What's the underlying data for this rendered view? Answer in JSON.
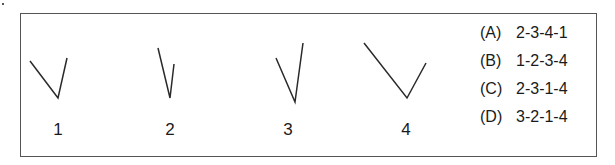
{
  "figures": [
    {
      "label": "1",
      "arm_a": [
        30,
        61
      ],
      "vertex": [
        58,
        98
      ],
      "arm_b": [
        67,
        58
      ],
      "label_x": 48
    },
    {
      "label": "2",
      "arm_a": [
        158,
        48
      ],
      "vertex": [
        170,
        98
      ],
      "arm_b": [
        174,
        64
      ],
      "label_x": 160
    },
    {
      "label": "3",
      "arm_a": [
        276,
        58
      ],
      "vertex": [
        295,
        102
      ],
      "arm_b": [
        303,
        43
      ],
      "label_x": 278
    },
    {
      "label": "4",
      "arm_a": [
        364,
        43
      ],
      "vertex": [
        407,
        98
      ],
      "arm_b": [
        426,
        63
      ],
      "label_x": 396
    }
  ],
  "options": [
    {
      "key": "(A)",
      "value": "2-3-4-1"
    },
    {
      "key": "(B)",
      "value": "1-2-3-4"
    },
    {
      "key": "(C)",
      "value": "2-3-1-4"
    },
    {
      "key": "(D)",
      "value": "3-2-1-4"
    }
  ],
  "colors": {
    "stroke": "#2a2a2a",
    "border": "#555555"
  }
}
